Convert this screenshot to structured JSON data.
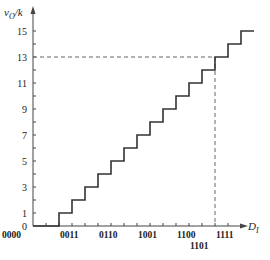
{
  "chart_data": {
    "type": "line",
    "subtype": "staircase",
    "title": "",
    "ylabel": "vO/k",
    "ylabel_main": "v",
    "ylabel_sub": "O",
    "ylabel_tail": "/k",
    "xlabel": "DI",
    "xlabel_main": "D",
    "xlabel_sub": "I",
    "ylim": [
      0,
      15
    ],
    "y_ticks_labeled": [
      "0",
      "1",
      "3",
      "5",
      "7",
      "9",
      "11",
      "13",
      "15"
    ],
    "y_tick_values_labeled": [
      0,
      1,
      3,
      5,
      7,
      9,
      11,
      13,
      15
    ],
    "x_codes": [
      "0000",
      "0001",
      "0010",
      "0011",
      "0100",
      "0101",
      "0110",
      "0111",
      "1000",
      "1001",
      "1010",
      "1011",
      "1100",
      "1101",
      "1110",
      "1111"
    ],
    "x_ticks_labeled": [
      {
        "code": "0000",
        "index": 0
      },
      {
        "code": "0011",
        "index": 3
      },
      {
        "code": "0110",
        "index": 6
      },
      {
        "code": "1001",
        "index": 9
      },
      {
        "code": "1100",
        "index": 12
      },
      {
        "code": "1101",
        "index": 13,
        "below": true
      },
      {
        "code": "1111",
        "index": 15
      }
    ],
    "x": [
      0,
      1,
      2,
      3,
      4,
      5,
      6,
      7,
      8,
      9,
      10,
      11,
      12,
      13,
      14,
      15
    ],
    "values": [
      0,
      1,
      2,
      3,
      4,
      5,
      6,
      7,
      8,
      9,
      10,
      11,
      12,
      13,
      14,
      15
    ],
    "annotations": [
      {
        "type": "dashed-guide",
        "x_code": "1101",
        "y": 13
      }
    ],
    "grid": false,
    "legend": null
  },
  "colors": {
    "line": "#333333",
    "axis": "#444444",
    "dashed": "#666666"
  }
}
